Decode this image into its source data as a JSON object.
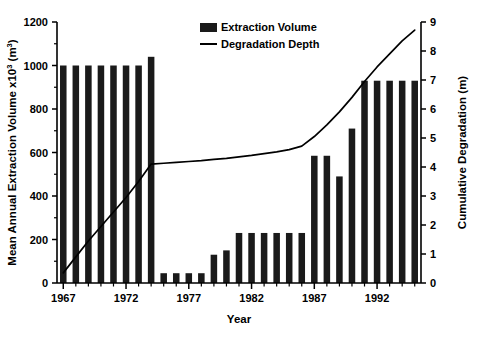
{
  "chart_data": {
    "type": "bar",
    "title": "",
    "subtitle": "",
    "xlabel": "Year",
    "ylabel": "Mean Annual Extraction Volume x10³ (m³)",
    "ylabel_right": "Cumulative Degradation (m)",
    "xlim": [
      1966,
      1996
    ],
    "ylim": [
      0,
      1200
    ],
    "ylim_right": [
      0,
      9
    ],
    "grid": false,
    "legend_position": "top-center",
    "categories": [
      "1967",
      "1968",
      "1969",
      "1970",
      "1971",
      "1972",
      "1973",
      "1974",
      "1975",
      "1976",
      "1977",
      "1978",
      "1979",
      "1980",
      "1981",
      "1982",
      "1983",
      "1984",
      "1985",
      "1986",
      "1987",
      "1988",
      "1989",
      "1990",
      "1991",
      "1992",
      "1993",
      "1994",
      "1995"
    ],
    "series": [
      {
        "name": "Extraction Volume",
        "type": "bar",
        "axis": "left",
        "color": "#1a1a1a",
        "values": [
          1000,
          1000,
          1000,
          1000,
          1000,
          1000,
          1000,
          1040,
          45,
          45,
          45,
          45,
          130,
          150,
          230,
          230,
          230,
          230,
          230,
          230,
          585,
          585,
          490,
          710,
          930,
          930,
          930,
          930,
          930
        ]
      },
      {
        "name": "Degradation Depth",
        "type": "line",
        "axis": "right",
        "color": "#000000",
        "values": [
          0.35,
          0.9,
          1.45,
          1.95,
          2.45,
          2.95,
          3.5,
          4.1,
          4.13,
          4.16,
          4.19,
          4.22,
          4.26,
          4.3,
          4.35,
          4.4,
          4.46,
          4.52,
          4.6,
          4.72,
          5.05,
          5.45,
          5.9,
          6.4,
          6.95,
          7.45,
          7.9,
          8.35,
          8.72
        ]
      }
    ],
    "y_ticks_left": [
      0,
      200,
      400,
      600,
      800,
      1000,
      1200
    ],
    "y_ticks_right": [
      0,
      1,
      2,
      3,
      4,
      5,
      6,
      7,
      8,
      9
    ],
    "x_ticks_major": [
      "1967",
      "1972",
      "1977",
      "1982",
      "1987",
      "1992"
    ],
    "legend": [
      {
        "label": "Extraction Volume",
        "marker": "bar-swatch"
      },
      {
        "label": "Degradation Depth",
        "marker": "line-swatch"
      }
    ]
  }
}
